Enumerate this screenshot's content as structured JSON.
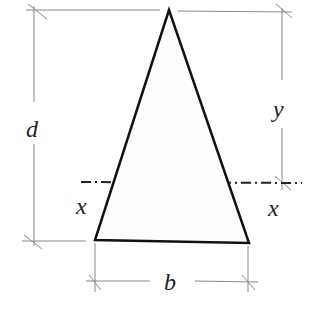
{
  "diagram": {
    "type": "isosceles-triangle-section",
    "labels": {
      "height": "d",
      "centroid_distance": "y",
      "axis_left": "x",
      "axis_right": "x",
      "base": "b"
    },
    "colors": {
      "outline": "#111111",
      "dimension": "#777777",
      "axis": "#222222"
    }
  }
}
